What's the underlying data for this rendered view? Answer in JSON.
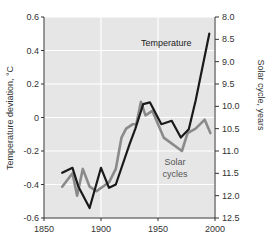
{
  "chart_data": {
    "type": "line",
    "title": "",
    "xlabel": "",
    "ylabel": "Temperature deviation, °C",
    "ylabel_right": "Solar cycle, years",
    "xlim": [
      1850,
      2000
    ],
    "ylim": [
      -0.6,
      0.6
    ],
    "ylim_right": [
      8.0,
      12.5
    ],
    "right_axis_inverted": true,
    "grid": true,
    "background": "#e6e6e6",
    "x_ticks": [
      "1850",
      "1900",
      "1950",
      "2000"
    ],
    "y_ticks": [
      "0.6",
      "0.4",
      "0.2",
      "0",
      "-0.2",
      "-0.4",
      "-0.6"
    ],
    "y_ticks_right": [
      "8.0",
      "8.5",
      "9.0",
      "9.5",
      "10.0",
      "10.5",
      "11.0",
      "11.5",
      "12.0",
      "12.5"
    ],
    "annotations": [
      {
        "text": "Temperature",
        "series": "Temperature"
      },
      {
        "text": "Solar",
        "series": "Solar cycles"
      },
      {
        "text": "cycles",
        "series": "Solar cycles"
      }
    ],
    "series": [
      {
        "name": "Temperature",
        "axis": "left",
        "color": "#1a1a1a",
        "x": [
          1866,
          1875,
          1880,
          1890,
          1900,
          1907,
          1913,
          1925,
          1930,
          1937,
          1943,
          1953,
          1962,
          1970,
          1977,
          1983,
          1995
        ],
        "values": [
          -0.33,
          -0.3,
          -0.41,
          -0.54,
          -0.3,
          -0.42,
          -0.4,
          -0.16,
          -0.07,
          0.08,
          0.09,
          -0.04,
          -0.02,
          -0.12,
          -0.07,
          0.1,
          0.5
        ]
      },
      {
        "name": "Solar cycles",
        "axis": "right",
        "color": "#8a8a8a",
        "x": [
          1866,
          1875,
          1879,
          1884,
          1890,
          1896,
          1907,
          1913,
          1918,
          1922,
          1928,
          1931,
          1935,
          1939,
          1945,
          1955,
          1971,
          1976,
          1983,
          1991,
          1996
        ],
        "values": [
          11.8,
          11.5,
          12.0,
          11.4,
          11.8,
          11.9,
          11.7,
          11.4,
          10.7,
          10.5,
          10.4,
          10.4,
          9.9,
          10.2,
          10.1,
          10.7,
          11.0,
          10.6,
          10.5,
          10.3,
          10.6
        ]
      }
    ]
  }
}
